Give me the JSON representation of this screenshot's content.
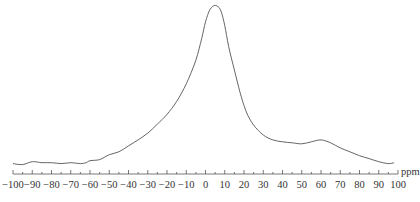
{
  "chart_data": {
    "type": "line",
    "title": "",
    "xlabel": "ppm",
    "ylabel": "",
    "xlim": [
      -100,
      100
    ],
    "x_reversed": false,
    "grid": false,
    "legend": null,
    "y_axis_shown": false,
    "x_ticks": [
      -100,
      -90,
      -80,
      -70,
      -60,
      -50,
      -40,
      -30,
      -20,
      -10,
      0,
      10,
      20,
      30,
      40,
      50,
      60,
      70,
      80,
      90,
      100
    ],
    "x_tick_labels": [
      "−100",
      "−90",
      "−80",
      "−70",
      "−60",
      "−50",
      "−40",
      "−30",
      "−20",
      "−10",
      "0",
      "10",
      "20",
      "30",
      "40",
      "50",
      "60",
      "70",
      "80",
      "90",
      "100"
    ],
    "minor_tick_step": 5,
    "series": [
      {
        "name": "spectrum",
        "x": [
          -100,
          -95,
          -90,
          -85,
          -80,
          -75,
          -70,
          -65,
          -62,
          -60,
          -55,
          -50,
          -45,
          -40,
          -35,
          -30,
          -25,
          -20,
          -15,
          -10,
          -5,
          -2,
          0,
          2,
          4,
          6,
          8,
          10,
          12,
          15,
          18,
          20,
          22,
          25,
          30,
          35,
          40,
          45,
          50,
          55,
          60,
          65,
          70,
          75,
          80,
          85,
          90,
          95,
          98
        ],
        "y": [
          3,
          2.4,
          4.2,
          3.6,
          3.6,
          3,
          3.6,
          3,
          3.6,
          4.8,
          5.5,
          8.5,
          10.3,
          13.9,
          17.6,
          21.8,
          27.3,
          33.3,
          41.2,
          52.1,
          66.7,
          80,
          90.3,
          97,
          100,
          100,
          97,
          87.9,
          75.2,
          60.6,
          46.7,
          38.8,
          32.7,
          26.7,
          20.6,
          17.6,
          16.4,
          15.8,
          15.2,
          16.4,
          17.6,
          15.8,
          12.7,
          10.3,
          7.9,
          6.1,
          4.2,
          3,
          3.6
        ]
      }
    ],
    "peak": {
      "x": 5,
      "y": 100
    },
    "shoulder": {
      "x": 60,
      "y": 17.6
    },
    "y_units": "relative intensity (arbitrary)"
  },
  "axis": {
    "unit_label": "ppm"
  }
}
